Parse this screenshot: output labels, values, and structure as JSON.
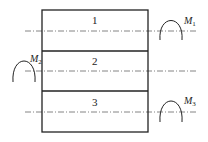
{
  "diagram": {
    "layers": [
      {
        "label": "1"
      },
      {
        "label": "2"
      },
      {
        "label": "3"
      }
    ],
    "moments": [
      {
        "symbol": "M",
        "subscript": "1",
        "side": "right",
        "layer": "1"
      },
      {
        "symbol": "M",
        "subscript": "2",
        "side": "left",
        "layer": "2"
      },
      {
        "symbol": "M",
        "subscript": "3",
        "side": "right",
        "layer": "3"
      }
    ],
    "colors": {
      "stroke": "#222222",
      "axis": "#555555",
      "background": "#ffffff"
    }
  }
}
